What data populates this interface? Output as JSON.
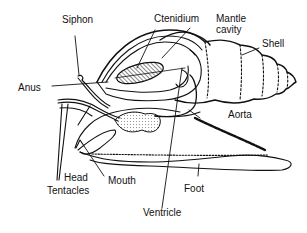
{
  "diagram": {
    "stroke_color": "#111111",
    "background": "#ffffff",
    "labels": {
      "siphon": "Siphon",
      "ctenidium": "Ctenidium",
      "mantle_line1": "Mantle",
      "mantle_line2": "cavity",
      "shell": "Shell",
      "anus": "Anus",
      "aorta": "Aorta",
      "head": "Head",
      "tentacles": "Tentacles",
      "mouth": "Mouth",
      "foot": "Foot",
      "ventricle": "Ventricle"
    }
  }
}
